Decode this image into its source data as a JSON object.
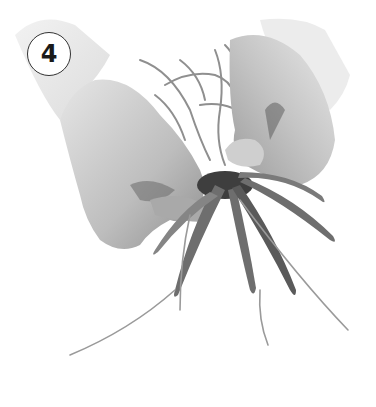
{
  "image": {
    "description": "Grayscale instructional photo: two hands gently separating the tangled roots and strap-like leaves of an orchid plant against a white background",
    "tone": "grayscale",
    "subjects": [
      "left-hand",
      "right-hand",
      "orchid-leaves",
      "orchid-roots"
    ]
  },
  "step_badge": {
    "number": "4"
  },
  "colors": {
    "background": "#ffffff",
    "skin_light": "#d9d9d9",
    "skin_mid": "#b5b5b5",
    "skin_shadow": "#8a8a8a",
    "leaf": "#6e6e6e",
    "leaf_dark": "#4a4a4a",
    "root": "#9a9a9a",
    "badge_border": "#333333",
    "badge_text": "#1a1a1a"
  }
}
